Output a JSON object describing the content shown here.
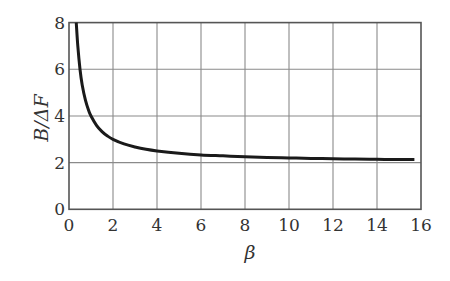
{
  "chart_data": {
    "type": "line",
    "title": "",
    "xlabel": "β",
    "ylabel": "B/ΔF",
    "xlim": [
      0,
      16
    ],
    "ylim": [
      0,
      8
    ],
    "xticks": [
      0,
      2,
      4,
      6,
      8,
      10,
      12,
      14,
      16
    ],
    "yticks": [
      0,
      2,
      4,
      6,
      8
    ],
    "grid": true,
    "legend": null,
    "series": [
      {
        "name": "B/ΔF",
        "color": "#1a1a1a",
        "x": [
          0.33,
          0.4,
          0.5,
          0.6,
          0.75,
          0.9,
          1.0,
          1.25,
          1.5,
          1.75,
          2.0,
          2.5,
          3.0,
          3.5,
          4.0,
          5.0,
          6.0,
          7.0,
          8.0,
          9.0,
          10.0,
          11.0,
          12.0,
          13.0,
          14.0,
          15.0,
          15.7
        ],
        "y": [
          8.0,
          7.0,
          6.0,
          5.33,
          4.67,
          4.22,
          4.0,
          3.6,
          3.33,
          3.14,
          3.0,
          2.8,
          2.67,
          2.57,
          2.5,
          2.4,
          2.33,
          2.29,
          2.25,
          2.22,
          2.2,
          2.18,
          2.17,
          2.15,
          2.14,
          2.13,
          2.13
        ]
      }
    ]
  },
  "colors": {
    "grid": "#8a8a8a",
    "axis": "#555555",
    "curve": "#1a1a1a",
    "text": "#333333"
  }
}
